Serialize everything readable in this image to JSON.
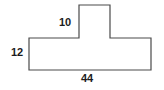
{
  "figure": {
    "kind": "plane-geometry-figure",
    "stroke_color": "#4a4a4a",
    "fill_color": "#ffffff",
    "background_color": "#ffffff",
    "label_color": "#1c1c1c",
    "stroke_width": 1.2,
    "outline_points": "29,38 79,38 79,5 110,5 110,38 151,38 151,70 29,70",
    "vertices": [
      {
        "name": "left-shoulder",
        "x": 29,
        "y": 38
      },
      {
        "name": "notch-left-base",
        "x": 79,
        "y": 38
      },
      {
        "name": "notch-top-left",
        "x": 79,
        "y": 5
      },
      {
        "name": "notch-top-right",
        "x": 110,
        "y": 5
      },
      {
        "name": "notch-right-base",
        "x": 110,
        "y": 38
      },
      {
        "name": "right-shoulder",
        "x": 151,
        "y": 38
      },
      {
        "name": "bottom-right",
        "x": 151,
        "y": 70
      },
      {
        "name": "bottom-left",
        "x": 29,
        "y": 70
      }
    ],
    "labels": {
      "top": "10",
      "left": "12",
      "bottom": "44"
    }
  }
}
